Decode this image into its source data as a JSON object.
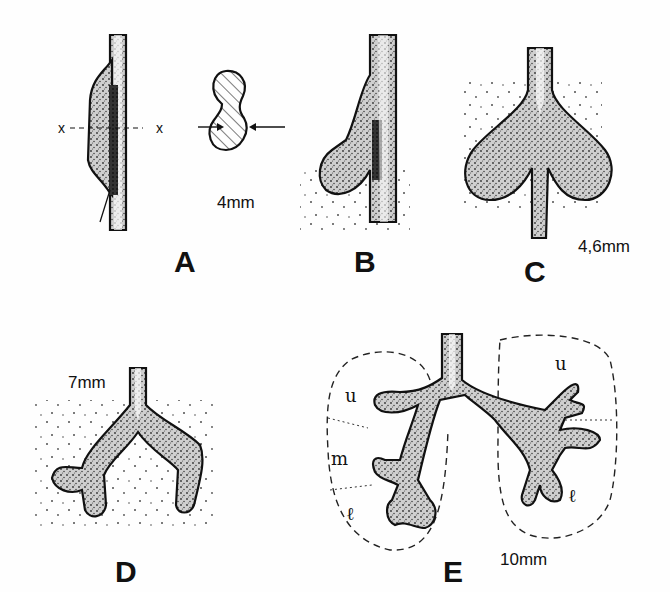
{
  "figure": {
    "background": "#fefefe",
    "ink_color": "#111111",
    "panels": [
      {
        "id": "A",
        "label": "A",
        "size": "4mm",
        "cross_section_marker": "x",
        "notes": "tracheal tube with ventral outgrowth; cross-section at x--x shows figure-eight (dumbbell) shape with hatching and opposing arrows"
      },
      {
        "id": "B",
        "label": "B",
        "size": "",
        "notes": "single lung bud outpouching from tube"
      },
      {
        "id": "C",
        "label": "C",
        "size": "4,6mm",
        "notes": "bilobed lung bud (two bronchial buds)"
      },
      {
        "id": "D",
        "label": "D",
        "size": "7mm",
        "notes": "primary bronchi with early secondary buds"
      },
      {
        "id": "E",
        "label": "E",
        "size": "10mm",
        "notes": "lobar branching with dashed lobe outlines",
        "lobe_labels": {
          "left": [
            "u",
            "m",
            "ℓ"
          ],
          "right": [
            "u",
            "ℓ"
          ]
        }
      }
    ]
  }
}
